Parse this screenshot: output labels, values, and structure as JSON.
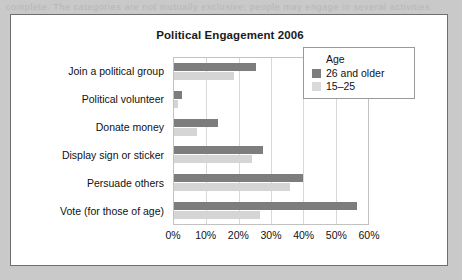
{
  "page": {
    "top_strip_text": "complete. The categories are not mutually exclusive; people may engage in several activities.",
    "background_color": "#c9c9c9",
    "panel_background": "#ffffff"
  },
  "chart_data": {
    "type": "bar",
    "orientation": "horizontal",
    "title": "Political Engagement 2006",
    "xlabel": "",
    "ylabel": "",
    "xlim": [
      0,
      60
    ],
    "xticks": [
      "0%",
      "10%",
      "20%",
      "30%",
      "40%",
      "50%",
      "60%"
    ],
    "xtick_values": [
      0,
      10,
      20,
      30,
      40,
      50,
      60
    ],
    "grid": true,
    "grid_axis": "x",
    "legend_position": "upper right (inside plot)",
    "legend_title": "Age",
    "categories": [
      "Join a political group",
      "Political volunteer",
      "Donate money",
      "Display sign or sticker",
      "Persuade others",
      "Vote (for those of age)"
    ],
    "series": [
      {
        "name": "26 and older",
        "color": "#7d7d7d",
        "values": [
          25.5,
          2.5,
          13.5,
          27.5,
          40,
          56.5
        ]
      },
      {
        "name": "15–25",
        "color": "#d5d5d5",
        "values": [
          18.5,
          1.2,
          7,
          24,
          36,
          26.5
        ]
      }
    ]
  },
  "legend": {
    "title": "Age",
    "entries": [
      {
        "label": "26 and older",
        "color": "#7d7d7d"
      },
      {
        "label": "15–25",
        "color": "#d9d9d9"
      }
    ]
  }
}
